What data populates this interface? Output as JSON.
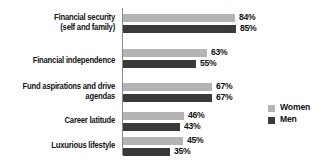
{
  "chart_data": {
    "type": "bar",
    "orientation": "horizontal",
    "title": "",
    "subtitle": "",
    "xlabel": "",
    "ylabel": "",
    "xlim": [
      0,
      100
    ],
    "grid": false,
    "value_suffix": "%",
    "legend_position": "right",
    "categories": [
      "Financial security\n(self and family)",
      "Financial independence",
      "Fund aspirations and drive\nagendas",
      "Career latitude",
      "Luxurious lifestyle"
    ],
    "series": [
      {
        "name": "Women",
        "color": "#b4b4b4",
        "values": [
          84,
          63,
          67,
          46,
          45
        ],
        "labels": [
          "84%",
          "63%",
          "67%",
          "46%",
          "45%"
        ]
      },
      {
        "name": "Men",
        "color": "#3a3a3a",
        "values": [
          85,
          55,
          67,
          43,
          35
        ],
        "labels": [
          "85%",
          "55%",
          "67%",
          "43%",
          "35%"
        ]
      }
    ]
  },
  "legend": {
    "items": [
      {
        "label": "Women",
        "color": "#b4b4b4"
      },
      {
        "label": "Men",
        "color": "#3a3a3a"
      }
    ]
  },
  "axis": {
    "line_color": "#8a8a8a"
  }
}
